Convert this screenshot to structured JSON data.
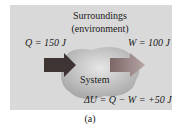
{
  "diagram": {
    "surroundings_label": "Surroundings",
    "environment_label": "(environment)",
    "heat_label": "Q = 150 J",
    "work_label": "W = 100 J",
    "system_label": "System",
    "energy_equation": "ΔU = Q − W = +50 J",
    "caption": "(a)",
    "colors": {
      "panel": "#d9d9d9",
      "system_blob": "#b8b8b8",
      "heat_arrow": "#4a3a3a",
      "work_arrow": "#8a7272"
    }
  }
}
